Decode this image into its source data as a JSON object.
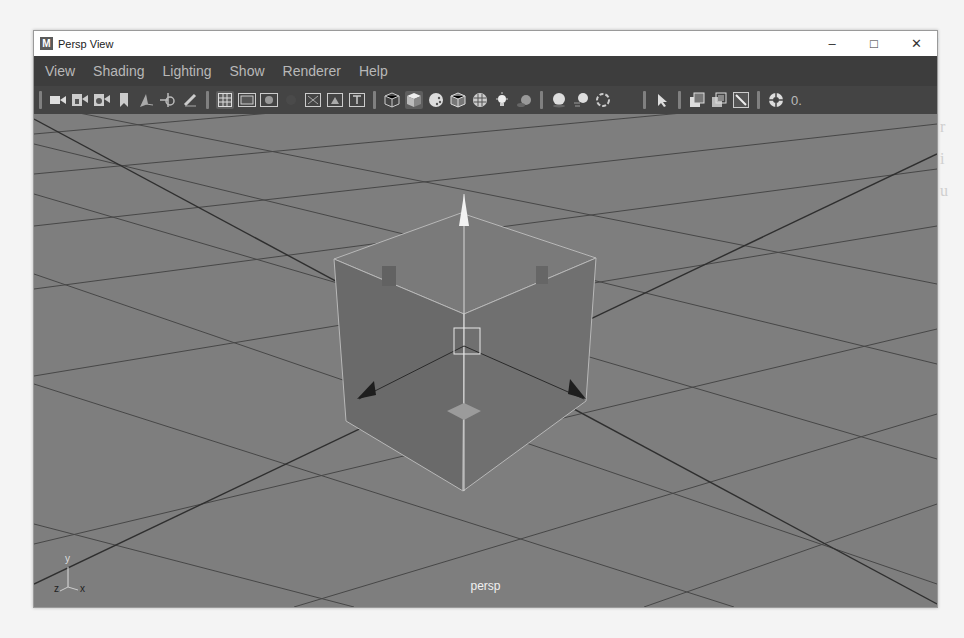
{
  "window": {
    "title": "Persp View",
    "app_icon_letter": "M",
    "controls": {
      "minimize": "–",
      "maximize": "□",
      "close": "✕"
    }
  },
  "menubar": {
    "items": [
      "View",
      "Shading",
      "Lighting",
      "Show",
      "Renderer",
      "Help"
    ]
  },
  "toolbar": {
    "groups": [
      [
        "select-camera-icon",
        "lock-camera-icon",
        "camera-attributes-icon",
        "bookmarks-icon",
        "image-plane-icon",
        "2d-pan-zoom-icon",
        "grease-pencil-icon"
      ],
      [
        "grid-icon",
        "film-gate-icon",
        "resolution-gate-icon",
        "gate-mask-icon",
        "field-chart-icon",
        "safe-action-icon",
        "safe-title-icon"
      ],
      [
        "wireframe-icon",
        "smooth-shade-icon",
        "default-material-icon",
        "wireframe-on-shaded-icon",
        "textured-icon",
        "use-all-lights-icon",
        "shadows-icon"
      ],
      [
        "screen-space-ao-icon",
        "motion-blur-icon",
        "anti-aliasing-icon"
      ],
      [
        "select-icon"
      ],
      [
        "isolate-select-icon",
        "xray-icon",
        "xray-joints-icon"
      ],
      [
        "exposure-icon"
      ]
    ],
    "exposure_value": "0."
  },
  "viewport": {
    "camera_label": "persp",
    "axis_labels": {
      "y": "y",
      "z": "z",
      "x": "x"
    },
    "colors": {
      "background": "#7e7e7e",
      "grid_line": "#3e3e3e",
      "cube_face": "#6d6d6d",
      "cube_edge": "#b8b8b8",
      "manipulator_up": "#f2f2f2",
      "manipulator_side": "#1e1e1e"
    }
  }
}
